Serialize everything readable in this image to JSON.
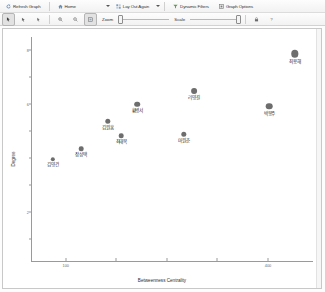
{
  "toolbar_top": {
    "refresh_label": "Refresh Graph",
    "home_label": "Home",
    "layout_label": "Lay Out Again",
    "filters_label": "Dynamic Filters",
    "options_label": "Graph Options"
  },
  "toolbar_bottom": {
    "zoom_label": "Zoom",
    "scale_label": "Scale",
    "zoom_value": 0,
    "scale_value": 100
  },
  "icons": {
    "refresh": "refresh-icon",
    "home": "home-icon",
    "layout": "layout-icon",
    "filters": "filter-icon",
    "options": "options-icon",
    "cursor": "cursor-icon",
    "pan": "pan-icon",
    "select": "select-icon",
    "zoom_in": "zoom-in-icon",
    "zoom_out": "zoom-out-icon",
    "fit": "fit-to-window-icon",
    "lock": "lock-icon",
    "help": "help-icon"
  },
  "chart_data": {
    "type": "scatter",
    "title": "",
    "xlabel": "Betweenness Centrality",
    "ylabel": "Degree",
    "xlim": [
      0,
      1
    ],
    "ylim": [
      0,
      1
    ],
    "grid": false,
    "legend": null,
    "xticks": [
      0.12,
      0.3,
      0.48,
      0.66,
      0.84
    ],
    "xticklabels": [
      "100",
      "",
      "",
      "",
      "400"
    ],
    "yticks": [
      0.1,
      0.22,
      0.34,
      0.46,
      0.58,
      0.7,
      0.82,
      0.94
    ],
    "yticklabels": [
      "",
      "2",
      "",
      "",
      "",
      "6",
      "",
      "8"
    ],
    "points": [
      {
        "label": "김영건",
        "x": 0.075,
        "y": 0.455,
        "size": 4.4
      },
      {
        "label": "장성택",
        "x": 0.175,
        "y": 0.5,
        "size": 4.6
      },
      {
        "label": "최태복",
        "x": 0.318,
        "y": 0.56,
        "size": 4.6
      },
      {
        "label": "김원홍",
        "x": 0.27,
        "y": 0.625,
        "size": 5.4
      },
      {
        "label": "황병서",
        "x": 0.375,
        "y": 0.7,
        "size": 5.6
      },
      {
        "label": "리영길",
        "x": 0.577,
        "y": 0.76,
        "size": 5.8
      },
      {
        "label": "마원춘",
        "x": 0.54,
        "y": 0.565,
        "size": 5.4
      },
      {
        "label": "박봉주",
        "x": 0.845,
        "y": 0.69,
        "size": 6.6
      },
      {
        "label": "최용해",
        "x": 0.935,
        "y": 0.925,
        "size": 7.4
      }
    ]
  }
}
